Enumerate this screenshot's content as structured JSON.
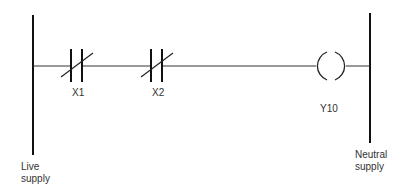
{
  "diagram": {
    "type": "ladder-logic",
    "rails": {
      "left_label_line1": "Live",
      "left_label_line2": "supply",
      "right_label_line1": "Neutral",
      "right_label_line2": "supply"
    },
    "rung": {
      "contacts": [
        {
          "label": "X1",
          "type": "normally-closed"
        },
        {
          "label": "X2",
          "type": "normally-closed"
        }
      ],
      "coil": {
        "label": "Y10",
        "type": "output-coil"
      }
    }
  }
}
